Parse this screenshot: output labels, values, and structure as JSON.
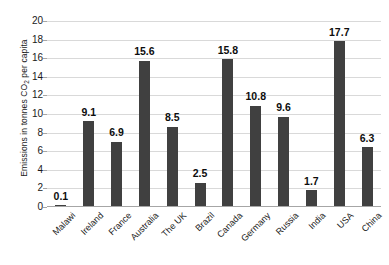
{
  "chart_data": {
    "type": "bar",
    "title": "",
    "xlabel": "",
    "ylabel": "Emissions in tonnes CO2 per capita",
    "ylabel_parts": {
      "pre": "Emissions in tonnes CO",
      "sub": "2",
      "post": " per capita"
    },
    "categories": [
      "Malawi",
      "Ireland",
      "France",
      "Australia",
      "The UK",
      "Brazil",
      "Canada",
      "Germany",
      "Russia",
      "India",
      "USA",
      "China"
    ],
    "values": [
      0.1,
      9.1,
      6.9,
      15.6,
      8.5,
      2.5,
      15.8,
      10.8,
      9.6,
      1.7,
      17.7,
      6.3
    ],
    "value_labels": [
      "0.1",
      "9.1",
      "6.9",
      "15.6",
      "8.5",
      "2.5",
      "15.8",
      "10.8",
      "9.6",
      "1.7",
      "17.7",
      "6.3"
    ],
    "ylim": [
      0,
      20
    ],
    "yticks": [
      0,
      2,
      4,
      6,
      8,
      10,
      12,
      14,
      16,
      18,
      20
    ],
    "ytick_labels": [
      "0",
      "2",
      "4",
      "6",
      "8",
      "10",
      "12",
      "14",
      "16",
      "18",
      "20"
    ],
    "grid": true,
    "grid_axis": "y",
    "legend": null,
    "legend_position": "none",
    "bar_color": "#404040",
    "grid_color": "#d9d9d9",
    "axis_color": "#a6a6a6",
    "text_color": "#1a1a1a",
    "background_color": "#ffffff"
  }
}
